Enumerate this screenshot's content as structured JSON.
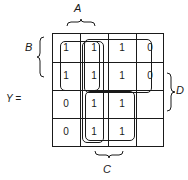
{
  "function_label": "Y =",
  "variables": {
    "A": "A",
    "B": "B",
    "C": "C",
    "D": "D"
  },
  "grid": {
    "rows": [
      [
        "1",
        "1",
        "1",
        "0"
      ],
      [
        "1",
        "1",
        "1",
        "0"
      ],
      [
        "0",
        "1",
        "1",
        ""
      ],
      [
        "0",
        "1",
        "1",
        ""
      ]
    ]
  },
  "groupings": [
    {
      "name": "loop-columns-1-2-rows-1-2",
      "cells": "rows 1-2, cols 1-2"
    },
    {
      "name": "loop-columns-2-3-rows-1-2",
      "cells": "rows 1-2, cols 2-3"
    },
    {
      "name": "loop-columns-2-3-all-rows",
      "cells": "rows 1-4, cols 2-3"
    }
  ]
}
